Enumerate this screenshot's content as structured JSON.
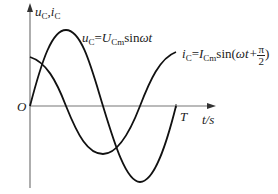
{
  "axes": {
    "y_label_main": "u",
    "y_label_sub1": "C",
    "y_label_sep": ",",
    "y_label_i": "i",
    "y_label_sub2": "C",
    "origin_label": "O",
    "x_label": "t/s",
    "period_label": "T"
  },
  "curves": {
    "voltage": {
      "lhs": "u",
      "lhs_sub": "C",
      "eq": "=",
      "amp": "U",
      "amp_sub": "Cm",
      "func": "sin",
      "arg": "ωt"
    },
    "current": {
      "lhs": "i",
      "lhs_sub": "C",
      "eq": "=",
      "amp": "I",
      "amp_sub": "Cm",
      "func": "sin(",
      "arg": "ωt+",
      "frac_num": "π",
      "frac_den": "2",
      "close": ")"
    }
  },
  "colors": {
    "curve": "#111111",
    "axis": "#777777"
  }
}
